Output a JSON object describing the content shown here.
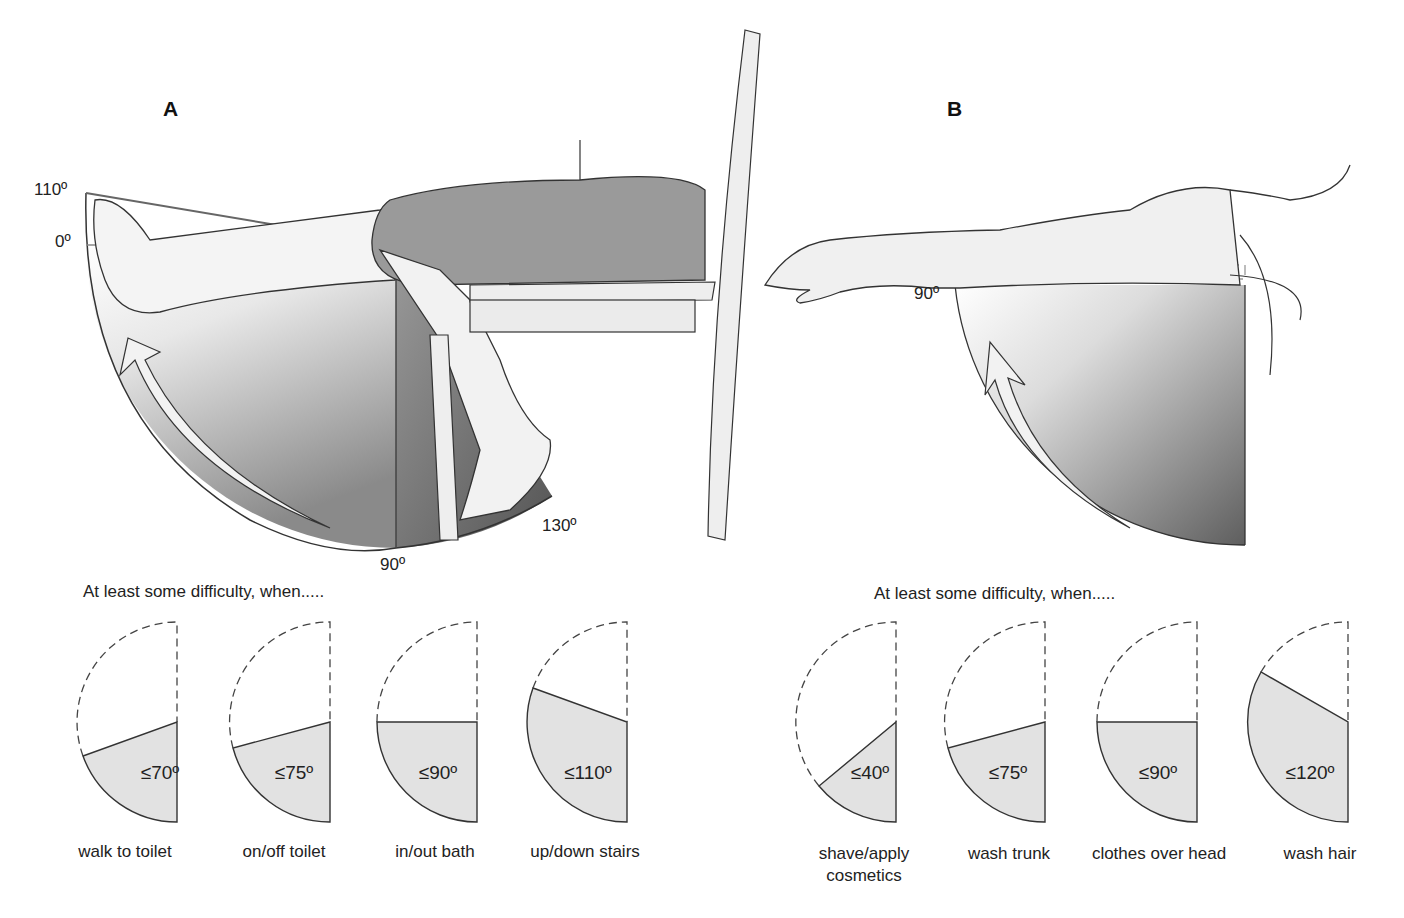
{
  "panel_a": {
    "letter": "A",
    "angles": {
      "top": "110º",
      "zero": "0º",
      "bottom": "90º",
      "end": "130º"
    },
    "heading": "At least some difficulty, when.....",
    "items": [
      {
        "label": "≤70º",
        "degrees": 70,
        "caption": "walk to toilet"
      },
      {
        "label": "≤75º",
        "degrees": 75,
        "caption": "on/off toilet"
      },
      {
        "label": "≤90º",
        "degrees": 90,
        "caption": "in/out bath"
      },
      {
        "label": "≤110º",
        "degrees": 110,
        "caption": "up/down stairs"
      }
    ]
  },
  "panel_b": {
    "letter": "B",
    "angles": {
      "arm": "90º"
    },
    "heading": "At least some difficulty, when.....",
    "items": [
      {
        "label": "≤40º",
        "degrees": 40,
        "caption": "shave/apply",
        "caption2": "cosmetics"
      },
      {
        "label": "≤75º",
        "degrees": 75,
        "caption": "wash trunk"
      },
      {
        "label": "≤90º",
        "degrees": 90,
        "caption": "clothes over head"
      },
      {
        "label": "≤120º",
        "degrees": 120,
        "caption": "wash hair"
      }
    ]
  },
  "colors": {
    "wedge_fill": "#e2e2e2",
    "stroke": "#333333",
    "shade_dark": "#6e6e6e"
  }
}
